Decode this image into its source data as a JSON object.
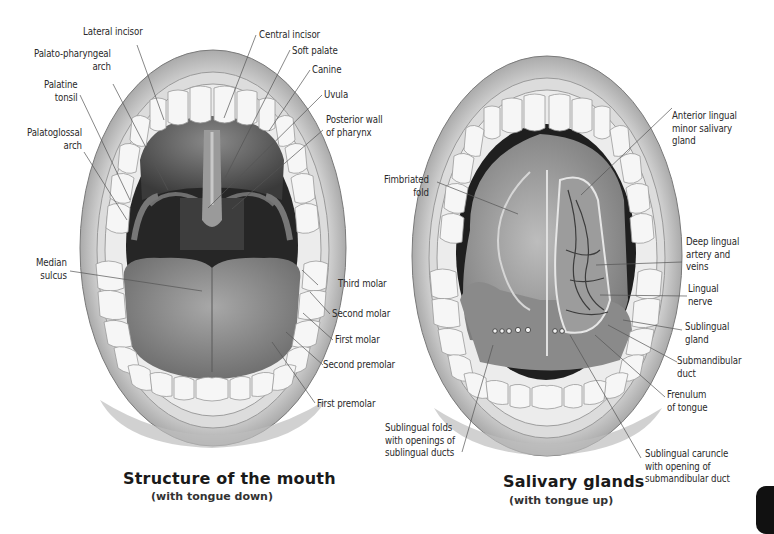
{
  "diagrams": [
    {
      "id": "mouth-structure",
      "title": "Structure of the mouth",
      "subtitle": "(with tongue down)",
      "labels": [
        {
          "text": "Lateral incisor"
        },
        {
          "text": "Central incisor"
        },
        {
          "text": "Palato-pharyngeal\narch"
        },
        {
          "text": "Soft palate"
        },
        {
          "text": "Canine"
        },
        {
          "text": "Palatine\ntonsil"
        },
        {
          "text": "Uvula"
        },
        {
          "text": "Posterior wall\nof pharynx"
        },
        {
          "text": "Palatoglossal\narch"
        },
        {
          "text": "Median\nsulcus"
        },
        {
          "text": "Third molar"
        },
        {
          "text": "Second molar"
        },
        {
          "text": "First molar"
        },
        {
          "text": "Second premolar"
        },
        {
          "text": "First premolar"
        }
      ]
    },
    {
      "id": "salivary-glands",
      "title": "Salivary glands",
      "subtitle": "(with tongue up)",
      "labels": [
        {
          "text": "Anterior lingual\nminor salivary\ngland"
        },
        {
          "text": "Fimbriated\nfold"
        },
        {
          "text": "Deep lingual\nartery and\nveins"
        },
        {
          "text": "Lingual\nnerve"
        },
        {
          "text": "Sublingual\ngland"
        },
        {
          "text": "Submandibular\nduct"
        },
        {
          "text": "Frenulum\nof tongue"
        },
        {
          "text": "Sublingual folds\nwith openings of\nsublingual ducts"
        },
        {
          "text": "Sublingual caruncle\nwith opening of\nsubmandibular duct"
        }
      ]
    }
  ],
  "colors": {
    "background": "#ffffff",
    "lip": "#b9b9b9",
    "tooth": "#f4f4f4",
    "tongue": "#8f8f8f",
    "cavity": "#2e2e2e",
    "leader_line": "#555555",
    "text": "#2a2a2a"
  }
}
